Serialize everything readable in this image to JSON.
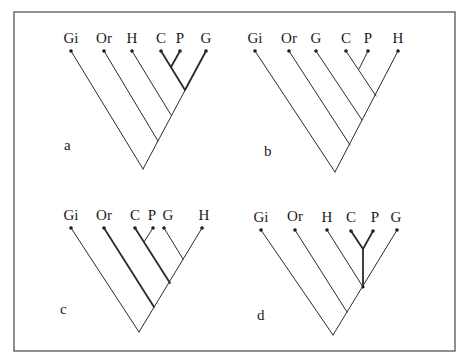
{
  "figure": {
    "panels": [
      {
        "id": "a",
        "label": "a",
        "taxa": [
          "Gi",
          "Or",
          "H",
          "C",
          "P",
          "G"
        ],
        "topology": "(Gi,(Or,(H,((C,P),G))))"
      },
      {
        "id": "b",
        "label": "b",
        "taxa": [
          "Gi",
          "Or",
          "G",
          "C",
          "P",
          "H"
        ],
        "topology": "(Gi,(Or,(G,((C,P),H))))"
      },
      {
        "id": "c",
        "label": "c",
        "taxa": [
          "Gi",
          "Or",
          "C",
          "P",
          "G",
          "H"
        ],
        "topology": "(Gi,(Or,((C,P),(G,H))))"
      },
      {
        "id": "d",
        "label": "d",
        "taxa": [
          "Gi",
          "Or",
          "H",
          "C",
          "P",
          "G"
        ],
        "topology": "(Gi,(Or,(H,(C,P),G)))"
      }
    ]
  }
}
